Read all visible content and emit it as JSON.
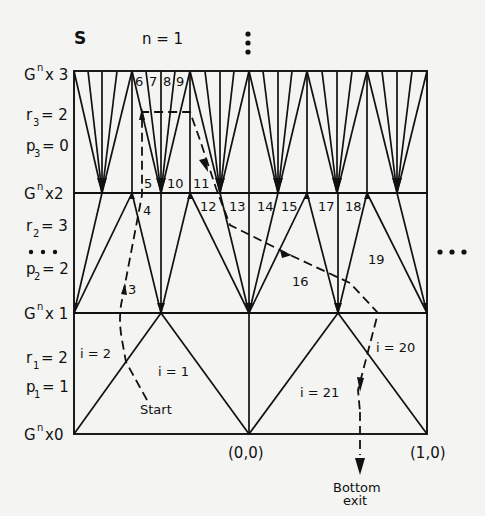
{
  "figure": {
    "corner_label": "S",
    "top_label": "n = 1",
    "vertical_ellipsis": "⋮",
    "right_ellipsis": "• • •",
    "left_ellipsis": "• • •"
  },
  "levels": [
    {
      "label": "G",
      "sup": "n",
      "suffix": "x 3"
    },
    {
      "label": "G",
      "sup": "n",
      "suffix": "x2"
    },
    {
      "label": "G",
      "sup": "n",
      "suffix": "x 1"
    },
    {
      "label": "G",
      "sup": "n",
      "suffix": "x0"
    }
  ],
  "params": {
    "r3": {
      "var": "r",
      "sub": "3",
      "val": "= 2"
    },
    "p3": {
      "var": "p",
      "sub": "3",
      "val": "= 0"
    },
    "r2": {
      "var": "r",
      "sub": "2",
      "val": "= 3"
    },
    "p2": {
      "var": "p",
      "sub": "2",
      "val": "= 2"
    },
    "r1": {
      "var": "r",
      "sub": "1",
      "val": "= 2"
    },
    "p1": {
      "var": "p",
      "sub": "1",
      "val": "= 1"
    }
  },
  "region_labels": {
    "i2": "i = 2",
    "i1": "i = 1",
    "start": "Start",
    "n3": "3",
    "n4": "4",
    "n5": "5",
    "n6": "6",
    "n7": "7",
    "n8": "8",
    "n9": "9",
    "n10": "10",
    "n11": "11",
    "n12": "12",
    "n13": "13",
    "n14": "14",
    "n15": "15",
    "n16": "16",
    "n17": "17",
    "n18": "18",
    "n19": "19",
    "i20": "i = 20",
    "i21": "i = 21"
  },
  "coordinates": {
    "origin": "(0,0)",
    "unit": "(1,0)"
  },
  "exit_label": {
    "line1": "Bottom",
    "line2": "exit"
  }
}
